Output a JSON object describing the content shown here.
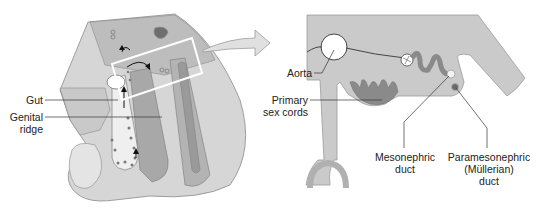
{
  "figure": {
    "left_panel": {
      "description": "Embryo section showing gut and genital ridge with highlighted region",
      "labels": {
        "gut": "Gut",
        "genital_ridge_line1": "Genital",
        "genital_ridge_line2": "ridge"
      }
    },
    "right_panel": {
      "description": "Magnified cross-section of highlighted region",
      "labels": {
        "aorta": "Aorta",
        "primary_sex_cords_line1": "Primary",
        "primary_sex_cords_line2": "sex cords",
        "mesonephric_line1": "Mesonephric",
        "mesonephric_line2": "duct",
        "paramesonephric_line1": "Paramesonephric",
        "paramesonephric_line2": "(Müllerian)",
        "paramesonephric_line3": "duct"
      }
    },
    "colors": {
      "tissue_light": "#d9d9d9",
      "tissue_mid": "#b8b8b8",
      "tissue_dark": "#8a8a8a",
      "highlight_box": "#ffffff",
      "outline": "#7a7a7a"
    }
  }
}
